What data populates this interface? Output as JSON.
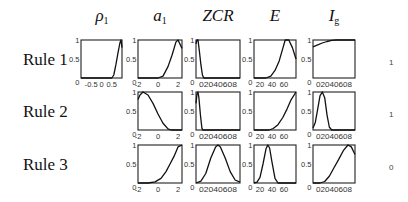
{
  "columns": [
    {
      "key": "rho1",
      "label": "ρ",
      "sub": "1"
    },
    {
      "key": "a1",
      "label": "a",
      "sub": "1"
    },
    {
      "key": "zcr",
      "label": "ZCR",
      "sub": ""
    },
    {
      "key": "e",
      "label": "E",
      "sub": ""
    },
    {
      "key": "ig",
      "label": "I",
      "sub": "g"
    }
  ],
  "rows": [
    {
      "label": "Rule 1",
      "output": "1"
    },
    {
      "label": "Rule 2",
      "output": "1"
    },
    {
      "label": "Rule 3",
      "output": "0"
    }
  ],
  "chart_data": {
    "type": "line",
    "title": "",
    "yticks": [
      "0",
      "0.5",
      "1"
    ],
    "ylim": [
      0,
      1
    ],
    "axes": {
      "rho1": {
        "xlim": [
          -1,
          1
        ],
        "xticks": [
          "-0.5",
          "0",
          "0.5"
        ],
        "xtick_pos": [
          -0.5,
          0,
          0.5
        ]
      },
      "a1": {
        "xlim": [
          -2,
          2.4
        ],
        "xticks": [
          "-2",
          "0",
          "2"
        ],
        "xtick_pos": [
          -2,
          0,
          2
        ]
      },
      "zcr": {
        "xlim": [
          0,
          0.9
        ],
        "xticks": [
          "0",
          "0.2",
          "0.4",
          "0.6",
          "0.8"
        ],
        "xtick_label": "0 20 40 60 8",
        "xtick_pos": [
          0,
          0.2,
          0.4,
          0.6,
          0.8
        ]
      },
      "e": {
        "xlim": [
          10,
          80
        ],
        "xticks": [
          "20",
          "40",
          "60"
        ],
        "xtick_pos": [
          20,
          40,
          60
        ]
      },
      "ig": {
        "xlim": [
          0,
          0.9
        ],
        "xticks": [
          "0",
          "0.2",
          "0.4",
          "0.6",
          "0.8"
        ],
        "xtick_label": "0 2040608",
        "xtick_pos": [
          0,
          0.2,
          0.4,
          0.6,
          0.8
        ]
      }
    },
    "series": [
      {
        "rule": "Rule 1",
        "feature": "rho1",
        "x": [
          -1,
          0.5,
          0.6,
          0.7,
          0.8,
          0.9,
          0.95,
          1.0
        ],
        "y": [
          0,
          0,
          0.08,
          0.35,
          0.65,
          0.92,
          1,
          0.8
        ]
      },
      {
        "rule": "Rule 1",
        "feature": "a1",
        "x": [
          -2,
          0,
          0.5,
          1.0,
          1.4,
          1.8,
          2.0,
          2.4
        ],
        "y": [
          0,
          0,
          0.05,
          0.3,
          0.6,
          0.95,
          1,
          0.78
        ]
      },
      {
        "rule": "Rule 1",
        "feature": "zcr",
        "x": [
          0,
          0.02,
          0.04,
          0.07,
          0.1,
          0.13,
          0.16,
          0.9
        ],
        "y": [
          0.9,
          1,
          1,
          0.7,
          0.35,
          0.08,
          0,
          0
        ]
      },
      {
        "rule": "Rule 1",
        "feature": "e",
        "x": [
          10,
          30,
          38,
          45,
          52,
          58,
          62,
          68,
          74,
          80
        ],
        "y": [
          0,
          0,
          0.05,
          0.2,
          0.45,
          0.78,
          1,
          1,
          0.8,
          0.5
        ]
      },
      {
        "rule": "Rule 1",
        "feature": "ig",
        "x": [
          0,
          0.1,
          0.2,
          0.3,
          0.4,
          0.5,
          0.9
        ],
        "y": [
          0.82,
          0.87,
          0.92,
          0.96,
          0.99,
          1,
          1
        ]
      },
      {
        "rule": "Rule 2",
        "feature": "a1",
        "x": [
          -2,
          -1.8,
          -1.5,
          -1.0,
          -0.5,
          0,
          0.5,
          1.0,
          1.3,
          2.4
        ],
        "y": [
          0.8,
          0.92,
          1,
          0.92,
          0.7,
          0.42,
          0.18,
          0.03,
          0,
          0
        ]
      },
      {
        "rule": "Rule 2",
        "feature": "zcr",
        "x": [
          0,
          0.02,
          0.04,
          0.06,
          0.09,
          0.12,
          0.14,
          0.9
        ],
        "y": [
          0.7,
          0.95,
          1,
          0.85,
          0.4,
          0.05,
          0,
          0
        ]
      },
      {
        "rule": "Rule 2",
        "feature": "e",
        "x": [
          10,
          35,
          42,
          50,
          58,
          65,
          72,
          80
        ],
        "y": [
          0,
          0,
          0.04,
          0.14,
          0.33,
          0.55,
          0.8,
          1
        ]
      },
      {
        "rule": "Rule 2",
        "feature": "ig",
        "x": [
          0,
          0.05,
          0.1,
          0.15,
          0.2,
          0.25,
          0.3,
          0.35,
          0.4,
          0.9
        ],
        "y": [
          0.05,
          0.2,
          0.55,
          0.9,
          1,
          0.85,
          0.4,
          0.08,
          0,
          0
        ]
      },
      {
        "rule": "Rule 3",
        "feature": "a1",
        "x": [
          -2,
          -1,
          -0.3,
          0.3,
          0.8,
          1.2,
          1.6,
          2.0,
          2.4
        ],
        "y": [
          0,
          0,
          0.03,
          0.12,
          0.3,
          0.5,
          0.7,
          0.95,
          1
        ]
      },
      {
        "rule": "Rule 3",
        "feature": "zcr",
        "x": [
          0,
          0.1,
          0.2,
          0.3,
          0.4,
          0.45,
          0.5,
          0.6,
          0.7,
          0.8,
          0.9
        ],
        "y": [
          0,
          0.05,
          0.25,
          0.65,
          0.95,
          1,
          0.95,
          0.65,
          0.3,
          0.08,
          0.02
        ]
      },
      {
        "rule": "Rule 3",
        "feature": "e",
        "x": [
          10,
          15,
          20,
          25,
          30,
          33,
          36,
          40,
          45,
          50,
          80
        ],
        "y": [
          0,
          0.02,
          0.15,
          0.5,
          0.9,
          1,
          0.92,
          0.55,
          0.12,
          0,
          0
        ]
      },
      {
        "rule": "Rule 3",
        "feature": "ig",
        "x": [
          0,
          0.15,
          0.25,
          0.35,
          0.45,
          0.55,
          0.65,
          0.75,
          0.82,
          0.9
        ],
        "y": [
          0,
          0,
          0.04,
          0.18,
          0.4,
          0.62,
          0.85,
          1,
          0.95,
          0.75
        ]
      }
    ],
    "outputs": [
      {
        "rule": "Rule 1",
        "value": 1
      },
      {
        "rule": "Rule 2",
        "value": 1
      },
      {
        "rule": "Rule 3",
        "value": 0
      }
    ],
    "grid": false,
    "legend": null
  }
}
